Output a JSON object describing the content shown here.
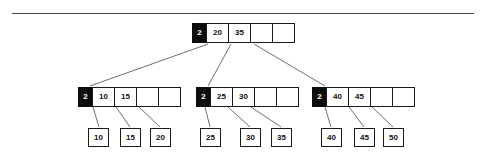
{
  "diagram": {
    "type": "b-tree",
    "title": "",
    "divider": {
      "name": "horizontal-rule"
    },
    "nodes": {
      "root": {
        "label": "root-node",
        "count": "2",
        "keys": [
          "20",
          "35"
        ],
        "empty_slots": 2,
        "x": 192,
        "y": 23
      },
      "internal_left": {
        "label": "internal-node-left",
        "count": "2",
        "keys": [
          "10",
          "15"
        ],
        "empty_slots": 2,
        "x": 78,
        "y": 87
      },
      "internal_middle": {
        "label": "internal-node-middle",
        "count": "2",
        "keys": [
          "25",
          "30"
        ],
        "empty_slots": 2,
        "x": 196,
        "y": 87
      },
      "internal_right": {
        "label": "internal-node-right",
        "count": "2",
        "keys": [
          "40",
          "45"
        ],
        "empty_slots": 2,
        "x": 312,
        "y": 87
      }
    },
    "leaves": [
      {
        "value": "10",
        "x": 88,
        "y": 128,
        "group": "left"
      },
      {
        "value": "15",
        "x": 120,
        "y": 128,
        "group": "left"
      },
      {
        "value": "20",
        "x": 150,
        "y": 128,
        "group": "left"
      },
      {
        "value": "25",
        "x": 200,
        "y": 128,
        "group": "middle"
      },
      {
        "value": "30",
        "x": 240,
        "y": 128,
        "group": "middle"
      },
      {
        "value": "35",
        "x": 271,
        "y": 128,
        "group": "middle"
      },
      {
        "value": "40",
        "x": 321,
        "y": 128,
        "group": "right"
      },
      {
        "value": "45",
        "x": 354,
        "y": 128,
        "group": "right"
      },
      {
        "value": "50",
        "x": 383,
        "y": 128,
        "group": "right"
      }
    ],
    "edges": [
      {
        "name": "edge-root-to-left",
        "x1": 208,
        "y1": 44,
        "x2": 90,
        "y2": 86
      },
      {
        "name": "edge-root-to-middle",
        "x1": 231,
        "y1": 44,
        "x2": 208,
        "y2": 86
      },
      {
        "name": "edge-root-to-right",
        "x1": 254,
        "y1": 44,
        "x2": 325,
        "y2": 86
      },
      {
        "name": "edge-left-to-leaf-10",
        "x1": 93,
        "y1": 107,
        "x2": 99,
        "y2": 127
      },
      {
        "name": "edge-left-to-leaf-15",
        "x1": 116,
        "y1": 107,
        "x2": 130,
        "y2": 127
      },
      {
        "name": "edge-left-to-leaf-20",
        "x1": 139,
        "y1": 107,
        "x2": 160,
        "y2": 127
      },
      {
        "name": "edge-middle-to-leaf-25",
        "x1": 205,
        "y1": 107,
        "x2": 210,
        "y2": 127
      },
      {
        "name": "edge-middle-to-leaf-30",
        "x1": 228,
        "y1": 107,
        "x2": 250,
        "y2": 127
      },
      {
        "name": "edge-middle-to-leaf-35",
        "x1": 251,
        "y1": 107,
        "x2": 281,
        "y2": 127
      },
      {
        "name": "edge-right-to-leaf-40",
        "x1": 325,
        "y1": 107,
        "x2": 331,
        "y2": 127
      },
      {
        "name": "edge-right-to-leaf-45",
        "x1": 349,
        "y1": 107,
        "x2": 364,
        "y2": 127
      },
      {
        "name": "edge-right-to-leaf-50",
        "x1": 372,
        "y1": 107,
        "x2": 393,
        "y2": 127
      }
    ]
  },
  "colors": {
    "node_border": "#1a1a1a",
    "count_cell_bg": "#0d0d0d",
    "count_cell_text": "#ffffff",
    "text": "#111111",
    "edge": "#6f6f6f",
    "rule": "#4a4a4a",
    "background": "#ffffff"
  }
}
